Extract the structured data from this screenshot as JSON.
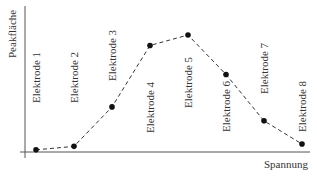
{
  "chart_data": {
    "type": "line",
    "title": "",
    "xlabel": "Spannung",
    "ylabel": "Peakfläche",
    "categories": [
      "Elektrode 1",
      "Elektrode 2",
      "Elektrode 3",
      "Elektrode 4",
      "Elektrode 5",
      "Elektrode 6",
      "Elektrode 7",
      "Elektrode 8"
    ],
    "values": [
      1,
      4,
      38,
      91,
      100,
      66,
      26,
      6
    ],
    "ylim": [
      0,
      100
    ],
    "grid": false,
    "legend": null,
    "line_style": "dashed",
    "marker": "filled-circle",
    "color": "#222222"
  }
}
